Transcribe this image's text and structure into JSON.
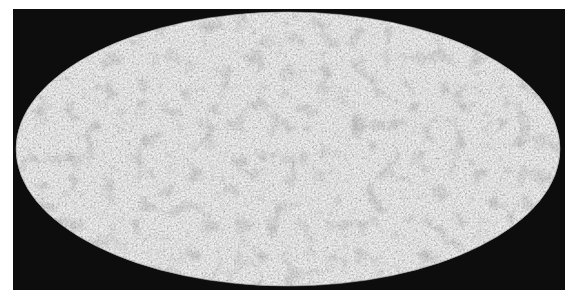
{
  "figure": {
    "projection": "mollweide",
    "colors": {
      "page_background": "#ffffff",
      "frame_background": "#0d0d0d",
      "map_base": "#c4c4c4",
      "map_dark_speckle": "#6a6a6a"
    },
    "ellipse": {
      "cx": 288,
      "cy": 149,
      "rx": 272,
      "ry": 137
    }
  }
}
